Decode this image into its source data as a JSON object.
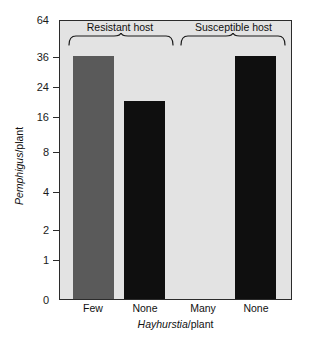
{
  "chart_data": {
    "type": "bar",
    "title": "",
    "subtitle": "",
    "xlabel": "Hayhurstia/plant",
    "xlabel_italic_part": "Hayhurstia",
    "xlabel_roman_part": "/plant",
    "ylabel": "Pemphigus/plant",
    "ylabel_italic_part": "Pemphigus",
    "ylabel_roman_part": "/plant",
    "categories": [
      "Few",
      "None",
      "Many",
      "None"
    ],
    "values": [
      36,
      20,
      0,
      36
    ],
    "bar_colors": [
      "#5a5a5a",
      "#0f0f0f",
      "#0f0f0f",
      "#0f0f0f"
    ],
    "ylim": [
      0,
      64
    ],
    "yticks": [
      0,
      1,
      2,
      4,
      8,
      16,
      24,
      36,
      64
    ],
    "ytick_labels": [
      "0",
      "1",
      "2",
      "4",
      "8",
      "16",
      "24",
      "36",
      "64"
    ],
    "ytick_positions_px": [
      300,
      260,
      230,
      192,
      152,
      117,
      87,
      57,
      20
    ],
    "yscale": "nonlinear-sqrt-like",
    "grid": false,
    "legend": false,
    "legend_position": "none",
    "annotations": [
      {
        "name": "resistant-host-bracket",
        "label": "Resistant host",
        "covers": [
          "Few",
          "None"
        ]
      },
      {
        "name": "susceptible-host-bracket",
        "label": "Susceptible host",
        "covers": [
          "Many",
          "None"
        ]
      }
    ],
    "plot_background": "#e3e3e3",
    "frame_color": "#2b2b2b"
  },
  "axes": {
    "y": {
      "label_italic": "Pemphigus",
      "label_roman": "/plant",
      "ticks": [
        {
          "value": 64,
          "label": "64",
          "y": 20
        },
        {
          "value": 36,
          "label": "36",
          "y": 57
        },
        {
          "value": 24,
          "label": "24",
          "y": 87
        },
        {
          "value": 16,
          "label": "16",
          "y": 117
        },
        {
          "value": 8,
          "label": "8",
          "y": 152
        },
        {
          "value": 4,
          "label": "4",
          "y": 192
        },
        {
          "value": 2,
          "label": "2",
          "y": 230
        },
        {
          "value": 1,
          "label": "1",
          "y": 260
        },
        {
          "value": 0,
          "label": "0",
          "y": 300
        }
      ]
    },
    "x": {
      "label_italic": "Hayhurstia",
      "label_roman": "/plant",
      "ticks": [
        {
          "label": "Few",
          "center": 93
        },
        {
          "label": "None",
          "center": 145
        },
        {
          "label": "Many",
          "center": 203
        },
        {
          "label": "None",
          "center": 256
        }
      ]
    }
  },
  "bars": [
    {
      "name": "bar-few-resistant",
      "category": "Few",
      "value": 36,
      "color": "#5a5a5a",
      "left": 73,
      "width": 41,
      "top": 56,
      "height": 244
    },
    {
      "name": "bar-none-resistant",
      "category": "None",
      "value": 20,
      "color": "#0f0f0f",
      "left": 124,
      "width": 41,
      "top": 99,
      "height": 201
    },
    {
      "name": "bar-many-susceptible",
      "category": "Many",
      "value": 0,
      "color": "#0f0f0f",
      "left": 183,
      "width": 41,
      "top": 300,
      "height": 0
    },
    {
      "name": "bar-none-susceptible",
      "category": "None",
      "value": 36,
      "color": "#0f0f0f",
      "left": 235,
      "width": 41,
      "top": 56,
      "height": 244
    }
  ],
  "groups": [
    {
      "name": "resistant-host",
      "label": "Resistant host",
      "label_center_x": 120,
      "label_y": 22,
      "brace_left": 68,
      "brace_right": 172,
      "brace_y": 34
    },
    {
      "name": "susceptible-host",
      "label": "Susceptible host",
      "label_center_x": 231,
      "label_y": 22,
      "brace_left": 180,
      "brace_right": 285,
      "brace_y": 34
    }
  ]
}
